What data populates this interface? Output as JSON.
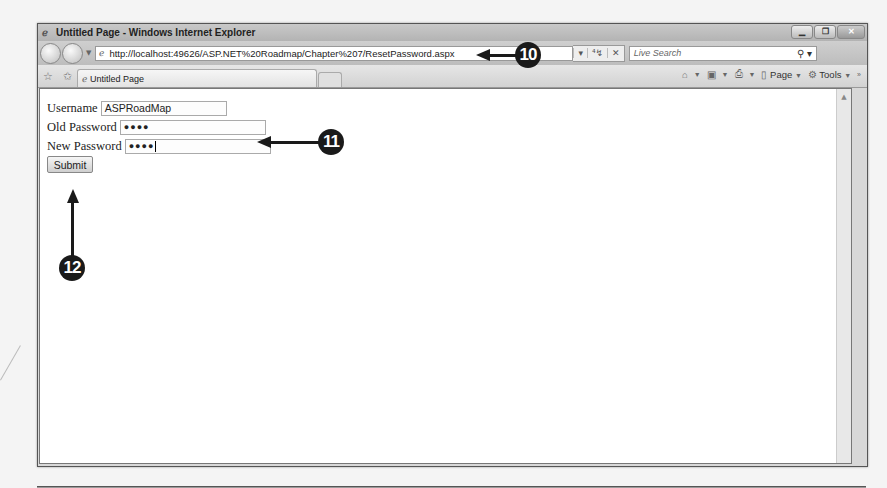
{
  "window": {
    "title": "Untitled Page - Windows Internet Explorer",
    "controls": [
      "minimize",
      "maximize",
      "close"
    ]
  },
  "navbar": {
    "back_icon": "back-arrow-icon",
    "forward_icon": "forward-arrow-icon",
    "address": "http://localhost:49626/ASP.NET%20Roadmap/Chapter%207/ResetPassword.aspx",
    "refresh_symbol": "⁴↯",
    "stop_symbol": "✕",
    "search_placeholder": "Live Search",
    "search_icon": "⌕"
  },
  "tabbar": {
    "tab_label": "Untitled Page",
    "commands": {
      "home": "home-icon",
      "feeds": "feeds-icon",
      "print": "print-icon",
      "page": "Page",
      "tools": "Tools"
    },
    "overflow": "»"
  },
  "form": {
    "username_label": "Username",
    "username_value": "ASPRoadMap",
    "old_password_label": "Old Password",
    "old_password_value": "●●●●",
    "new_password_label": "New Password",
    "new_password_value": "●●●●",
    "submit_label": "Submit"
  },
  "callouts": {
    "address_callout": "10",
    "password_callout": "11",
    "submit_callout": "12"
  }
}
